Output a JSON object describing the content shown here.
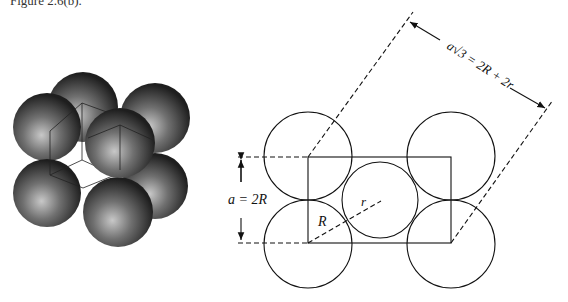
{
  "caption": "Figure 2.6(b).",
  "left_figure": {
    "description": "3D rendering of eight shaded spheres packed around a cube (cubic unit cell)",
    "sphere_color": "#3a3a3a",
    "highlight_color": "#bfbfbf"
  },
  "right_figure": {
    "labels": {
      "diagonal": "a√3 = 2R + 2r",
      "diagonal_a": "a",
      "diagonal_rest": "√3 = 2R + 2r",
      "edge": "a = 2R",
      "large_radius": "R",
      "small_radius": "r"
    },
    "line_color": "#111111"
  }
}
